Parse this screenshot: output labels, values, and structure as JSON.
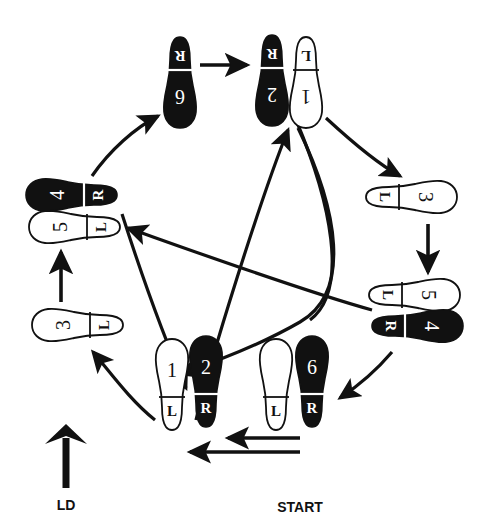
{
  "figure": {
    "type": "dance-step-diagram",
    "title": "",
    "background_color": "#ffffff",
    "ink_color": "#111111",
    "fill_black": "#111111",
    "fill_white": "#ffffff"
  },
  "labels": {
    "start": "START",
    "line_of_dance": "LD"
  },
  "legend": {
    "left_foot_mark": "L",
    "right_foot_mark": "R",
    "black_means": "R",
    "white_means": "L"
  },
  "footprints": [
    {
      "id": "start-left",
      "step": "",
      "foot": "L",
      "heel_label": "L",
      "fill": "white",
      "rotation": 0,
      "x": 276,
      "y": 385,
      "group": "start"
    },
    {
      "id": "start-right-6",
      "step": "6",
      "foot": "R",
      "heel_label": "R",
      "fill": "black",
      "rotation": 0,
      "x": 312,
      "y": 382,
      "group": "start"
    },
    {
      "id": "bottom-1",
      "step": "1",
      "foot": "L",
      "heel_label": "L",
      "fill": "white",
      "rotation": 0,
      "x": 172,
      "y": 385,
      "group": "bottom"
    },
    {
      "id": "bottom-2",
      "step": "2",
      "foot": "R",
      "heel_label": "R",
      "fill": "black",
      "rotation": 0,
      "x": 206,
      "y": 382,
      "group": "bottom"
    },
    {
      "id": "left-3",
      "step": "3",
      "foot": "L",
      "heel_label": "L",
      "fill": "white",
      "rotation": 270,
      "x": 78,
      "y": 325,
      "group": "left-lower"
    },
    {
      "id": "left-5",
      "step": "5",
      "foot": "L",
      "heel_label": "L",
      "fill": "white",
      "rotation": 270,
      "x": 75,
      "y": 227,
      "group": "left-upper"
    },
    {
      "id": "left-4",
      "step": "4",
      "foot": "R",
      "heel_label": "R",
      "fill": "black",
      "rotation": 270,
      "x": 72,
      "y": 195,
      "group": "left-upper"
    },
    {
      "id": "top-6",
      "step": "6",
      "foot": "R",
      "heel_label": "R",
      "fill": "black",
      "rotation": 180,
      "x": 180,
      "y": 82,
      "group": "top-left"
    },
    {
      "id": "top-2",
      "step": "2",
      "foot": "R",
      "heel_label": "R",
      "fill": "black",
      "rotation": 180,
      "x": 272,
      "y": 80,
      "group": "top-right"
    },
    {
      "id": "top-1",
      "step": "1",
      "foot": "L",
      "heel_label": "L",
      "fill": "white",
      "rotation": 180,
      "x": 306,
      "y": 82,
      "group": "top-right"
    },
    {
      "id": "right-3",
      "step": "3",
      "foot": "L",
      "heel_label": "L",
      "fill": "white",
      "rotation": 90,
      "x": 411,
      "y": 197,
      "group": "right-upper"
    },
    {
      "id": "right-5",
      "step": "5",
      "foot": "L",
      "heel_label": "L",
      "fill": "white",
      "rotation": 90,
      "x": 414,
      "y": 295,
      "group": "right-lower"
    },
    {
      "id": "right-4",
      "step": "4",
      "foot": "R",
      "heel_label": "R",
      "fill": "black",
      "rotation": 90,
      "x": 417,
      "y": 326,
      "group": "right-lower"
    }
  ],
  "arrows": [
    {
      "id": "start-to-bottom-upper",
      "kind": "straight",
      "from": "start",
      "to": "bottom-1-2",
      "direction": "left"
    },
    {
      "id": "start-to-bottom-lower",
      "kind": "straight",
      "from": "start",
      "to": "bottom-1-2",
      "direction": "left"
    },
    {
      "id": "bottom-to-left-3",
      "kind": "curved",
      "from": "bottom-1-2",
      "to": "left-3",
      "direction": "up-left"
    },
    {
      "id": "left-3-to-left-5",
      "kind": "straight",
      "from": "left-3",
      "to": "left-5",
      "direction": "up"
    },
    {
      "id": "left-4-to-top-6",
      "kind": "curved",
      "from": "left-4",
      "to": "top-6",
      "direction": "up-right"
    },
    {
      "id": "top-6-to-top-2",
      "kind": "straight",
      "from": "top-6",
      "to": "top-2",
      "direction": "right"
    },
    {
      "id": "top-1-to-right-3",
      "kind": "curved",
      "from": "top-1",
      "to": "right-3",
      "direction": "down-right"
    },
    {
      "id": "right-3-to-right-5",
      "kind": "straight",
      "from": "right-3",
      "to": "right-5",
      "direction": "down"
    },
    {
      "id": "right-4-to-start",
      "kind": "curved",
      "from": "right-4",
      "to": "start",
      "direction": "down-left"
    },
    {
      "id": "long-bottom-to-top",
      "kind": "long-diagonal",
      "from": "bottom-1-2",
      "to": "top-1-2",
      "direction": "up-right"
    },
    {
      "id": "long-top-to-bottom",
      "kind": "long-diagonal",
      "from": "top-2",
      "to": "bottom-2",
      "direction": "down-left"
    },
    {
      "id": "long-right-to-left",
      "kind": "long-diagonal",
      "from": "right-4-5",
      "to": "left-4-5",
      "direction": "up-left"
    },
    {
      "id": "long-left-to-right",
      "kind": "long-diagonal",
      "from": "left-5",
      "to": "right-4",
      "direction": "down-right"
    }
  ],
  "ld_arrow": {
    "label": "LD",
    "direction": "up",
    "x": 66,
    "y": 455
  }
}
